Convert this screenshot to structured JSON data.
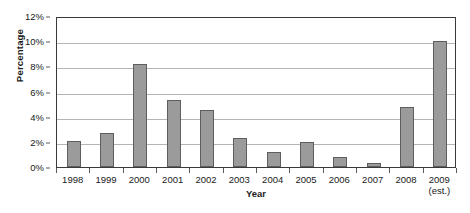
{
  "chart_data": {
    "type": "bar",
    "title": "",
    "xlabel": "Year",
    "ylabel": "Percentage",
    "categories": [
      "1998",
      "1999",
      "2000",
      "2001",
      "2002",
      "2003",
      "2004",
      "2005",
      "2006",
      "2007",
      "2008",
      "2009"
    ],
    "category_sublabels": [
      "",
      "",
      "",
      "",
      "",
      "",
      "",
      "",
      "",
      "",
      "",
      "(est.)"
    ],
    "values": [
      2.1,
      2.7,
      8.2,
      5.3,
      4.5,
      2.3,
      1.2,
      2.0,
      0.8,
      0.3,
      4.8,
      10.0
    ],
    "ylim": [
      0,
      12
    ],
    "y_ticks": [
      0,
      2,
      4,
      6,
      8,
      10,
      12
    ],
    "y_tick_labels": [
      "0%",
      "2%",
      "4%",
      "6%",
      "8%",
      "10%",
      "12%"
    ],
    "grid": true,
    "grid_axis": "y",
    "legend": false,
    "bar_color": "#9b9b9b",
    "bar_border_color": "#5e5e5e",
    "gridline_color": "#b4b4b4",
    "frame_color": "#3a3a3a",
    "background": "#ffffff"
  }
}
